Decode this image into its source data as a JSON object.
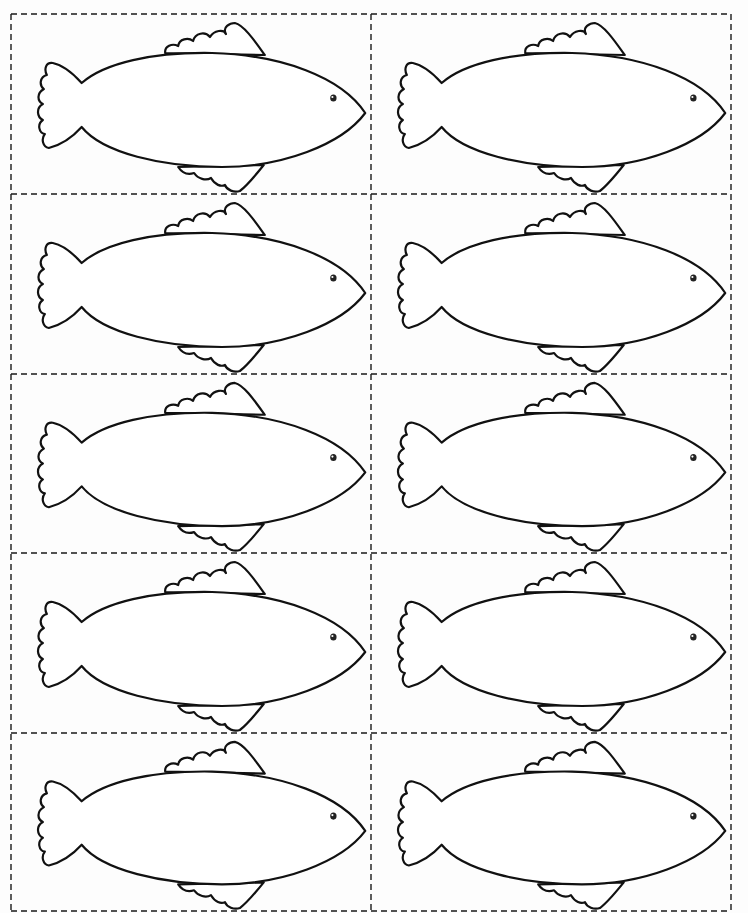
{
  "worksheet": {
    "title": "",
    "grid": {
      "rows": 5,
      "columns": 2,
      "line_style": "dashed cut lines"
    },
    "cells": [
      {
        "row": 1,
        "column": 1,
        "shape": "fish"
      },
      {
        "row": 1,
        "column": 2,
        "shape": "fish"
      },
      {
        "row": 2,
        "column": 1,
        "shape": "fish"
      },
      {
        "row": 2,
        "column": 2,
        "shape": "fish"
      },
      {
        "row": 3,
        "column": 1,
        "shape": "fish"
      },
      {
        "row": 3,
        "column": 2,
        "shape": "fish"
      },
      {
        "row": 4,
        "column": 1,
        "shape": "fish"
      },
      {
        "row": 4,
        "column": 2,
        "shape": "fish"
      },
      {
        "row": 5,
        "column": 1,
        "shape": "fish"
      },
      {
        "row": 5,
        "column": 2,
        "shape": "fish"
      }
    ],
    "fish": {
      "parts": [
        "body",
        "tail",
        "dorsal-fin",
        "belly-fin",
        "eye"
      ],
      "facing": "right"
    },
    "colors": {
      "paper": "#fdfdfd",
      "outline": "#111111",
      "fill": "#ffffff",
      "cut_line": "#1a1a1a"
    }
  }
}
